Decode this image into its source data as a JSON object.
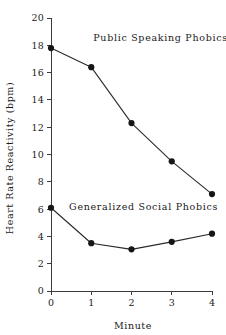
{
  "chart_data": {
    "type": "line",
    "title": "",
    "xlabel": "Minute",
    "ylabel": "Heart Rate Reactivity (bpm)",
    "x": [
      0,
      1,
      2,
      3,
      4
    ],
    "xticklabels": [
      "0",
      "1",
      "2",
      "3",
      "4"
    ],
    "yticks": [
      0,
      2,
      4,
      6,
      8,
      10,
      12,
      14,
      16,
      18,
      20
    ],
    "yticklabels": [
      "0",
      "2",
      "4",
      "6",
      "8",
      "10",
      "12",
      "14",
      "16",
      "18",
      "20"
    ],
    "xlim": [
      0,
      4
    ],
    "ylim": [
      0,
      20
    ],
    "grid": false,
    "legend": "inline-annotations",
    "series": [
      {
        "name": "Public Speaking Phobics",
        "values": [
          17.8,
          16.4,
          12.3,
          9.5,
          7.1
        ],
        "label_x": 1.05,
        "label_y": 18.3,
        "marker": "filled-circle",
        "color": "#161616"
      },
      {
        "name": "Generalized Social Phobics",
        "values": [
          6.1,
          3.5,
          3.05,
          3.6,
          4.2
        ],
        "label_x": 0.45,
        "label_y": 5.9,
        "marker": "filled-circle",
        "color": "#161616"
      }
    ],
    "annotations": [
      {
        "text": "Public Speaking Phobics"
      },
      {
        "text": "Generalized Social Phobics"
      }
    ]
  },
  "figure": {
    "background_color": "#ffffff",
    "axis_color": "#3b3b3b",
    "text_color": "#1a1a1a"
  }
}
